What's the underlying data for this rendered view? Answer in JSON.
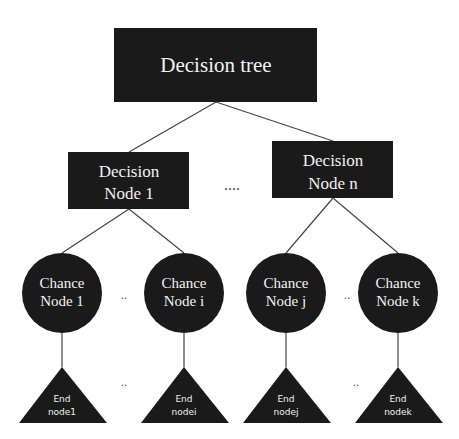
{
  "diagram": {
    "type": "decision-tree",
    "root": {
      "label": "Decision tree"
    },
    "decision_nodes": [
      {
        "line1": "Decision",
        "line2": "Node 1"
      },
      {
        "line1": "Decision",
        "line2": "Node n"
      }
    ],
    "decision_ellipsis": "....",
    "chance_nodes": [
      {
        "line1": "Chance",
        "line2": "Node 1"
      },
      {
        "line1": "Chance",
        "line2": "Node i"
      },
      {
        "line1": "Chance",
        "line2": "Node j"
      },
      {
        "line1": "Chance",
        "line2": "Node k"
      }
    ],
    "chance_ellipsis": "..",
    "end_nodes": [
      {
        "line1": "End",
        "line2": "node1"
      },
      {
        "line1": "End",
        "line2": "nodei"
      },
      {
        "line1": "End",
        "line2": "nodej"
      },
      {
        "line1": "End",
        "line2": "nodek"
      }
    ],
    "end_ellipsis": "..",
    "colors": {
      "node_fill": "#1a1a1a",
      "node_text": "#f2f2f2",
      "edge": "#444444",
      "background": "#ffffff"
    }
  }
}
